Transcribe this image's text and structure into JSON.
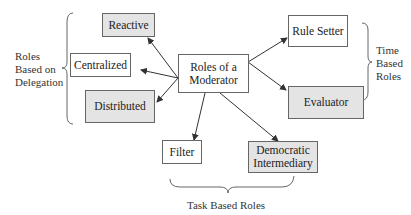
{
  "diagram": {
    "center": {
      "label_line1": "Roles of a",
      "label_line2": "Moderator"
    },
    "nodes": {
      "reactive": {
        "label": "Reactive",
        "shaded": true
      },
      "centralized": {
        "label": "Centralized",
        "shaded": false
      },
      "distributed": {
        "label": "Distributed",
        "shaded": true
      },
      "rule_setter": {
        "label": "Rule Setter",
        "shaded": false
      },
      "evaluator": {
        "label": "Evaluator",
        "shaded": true
      },
      "filter": {
        "label": "Filter",
        "shaded": false
      },
      "democratic_intermediary": {
        "label_line1": "Democratic",
        "label_line2": "Intermediary",
        "shaded": true
      }
    },
    "groups": {
      "delegation": {
        "line1": "Roles",
        "line2": "Based on",
        "line3": "Delegation"
      },
      "time": {
        "line1": "Time",
        "line2": "Based",
        "line3": "Roles"
      },
      "task": {
        "label": "Task Based Roles"
      }
    },
    "colors": {
      "shaded_fill": "#e4e4e4",
      "border": "#666666",
      "arrow": "#333333"
    }
  }
}
